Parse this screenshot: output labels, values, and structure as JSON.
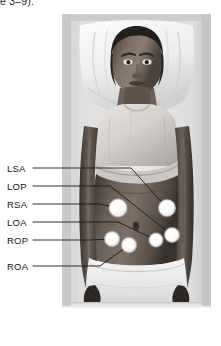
{
  "figure": {
    "caption_fragment": "e 3–9).",
    "type": "clinical-photograph",
    "photo": {
      "left": 62,
      "top": 14,
      "width": 149,
      "height": 294,
      "background_color": "#d2d2d2",
      "frame_color": "#b9b9b9"
    },
    "marker_color": "#ffffff",
    "leader_color": "#1a1a1a",
    "text_color": "#161616",
    "callouts": [
      {
        "label": "LSA",
        "label_x": 7,
        "label_y": 164,
        "line_start_x": 33,
        "line_start_y": 168,
        "elbow_x": 131,
        "elbow_y": 168,
        "dot_x": 167,
        "dot_y": 208,
        "dot_r": 8.0
      },
      {
        "label": "LOP",
        "label_x": 7,
        "label_y": 182,
        "line_start_x": 33,
        "line_start_y": 186,
        "elbow_x": 110,
        "elbow_y": 186,
        "dot_x": 172,
        "dot_y": 235,
        "dot_r": 7.0
      },
      {
        "label": "RSA",
        "label_x": 7,
        "label_y": 200,
        "line_start_x": 33,
        "line_start_y": 204,
        "elbow_x": 100,
        "elbow_y": 204,
        "dot_x": 118,
        "dot_y": 208,
        "dot_r": 8.5
      },
      {
        "label": "LOA",
        "label_x": 7,
        "label_y": 218,
        "line_start_x": 33,
        "line_start_y": 222,
        "elbow_x": 118,
        "elbow_y": 222,
        "dot_x": 156,
        "dot_y": 240,
        "dot_r": 6.5
      },
      {
        "label": "ROP",
        "label_x": 7,
        "label_y": 236,
        "line_start_x": 33,
        "line_start_y": 240,
        "elbow_x": 90,
        "elbow_y": 240,
        "dot_x": 112,
        "dot_y": 239,
        "dot_r": 7.0
      },
      {
        "label": "ROA",
        "label_x": 7,
        "label_y": 262,
        "line_start_x": 33,
        "line_start_y": 266,
        "elbow_x": 100,
        "elbow_y": 266,
        "dot_x": 129,
        "dot_y": 245,
        "dot_r": 7.0
      }
    ]
  }
}
